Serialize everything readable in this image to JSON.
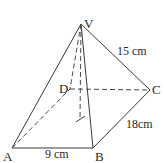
{
  "diagram": {
    "type": "square-based pyramid (rectangular base)",
    "vertices": {
      "V": {
        "label": "V",
        "x": 81,
        "y": 24
      },
      "A": {
        "label": "A",
        "x": 12,
        "y": 148
      },
      "B": {
        "label": "B",
        "x": 93,
        "y": 148
      },
      "C": {
        "label": "C",
        "x": 150,
        "y": 90
      },
      "D": {
        "label": "D",
        "x": 70,
        "y": 89
      },
      "O": {
        "label": "",
        "x": 80,
        "y": 119
      }
    },
    "measurements": {
      "AB": "9 cm",
      "BC": "18cm",
      "VC": "15 cm"
    },
    "colors": {
      "line": "#3a3a3a",
      "text": "#2a2a2a",
      "background": "#ffffff"
    }
  }
}
